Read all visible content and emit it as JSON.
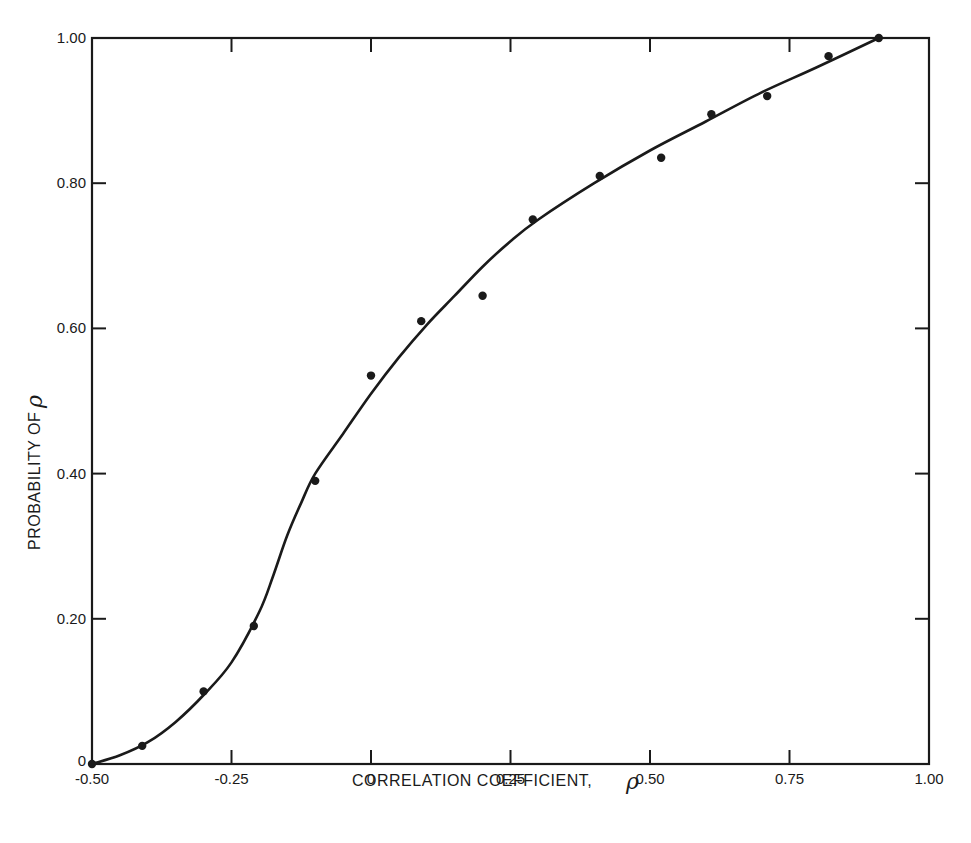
{
  "chart_data": {
    "type": "scatter",
    "title": "",
    "xlabel": "CORRELATION COEFFICIENT, ρ",
    "ylabel": "PROBABILITY OF ρ",
    "xlim": [
      -0.5,
      1.0
    ],
    "ylim": [
      0,
      1.0
    ],
    "grid": false,
    "legend": null,
    "x_ticks": [
      -0.5,
      -0.25,
      0,
      0.25,
      0.5,
      0.75,
      1.0
    ],
    "x_tick_labels": [
      "-0.50",
      "-0.25",
      "0",
      "0.25",
      "0.50",
      "0.75",
      "1.00"
    ],
    "y_ticks": [
      0,
      0.2,
      0.4,
      0.6,
      0.8,
      1.0
    ],
    "y_tick_labels": [
      "0",
      "0.20",
      "0.40",
      "0.60",
      "0.80",
      "1.00"
    ],
    "series": [
      {
        "name": "observed",
        "kind": "points",
        "x": [
          -0.5,
          -0.41,
          -0.3,
          -0.21,
          -0.1,
          0.0,
          0.09,
          0.2,
          0.29,
          0.41,
          0.52,
          0.61,
          0.71,
          0.82,
          0.91
        ],
        "y": [
          0.0,
          0.025,
          0.1,
          0.19,
          0.39,
          0.535,
          0.61,
          0.645,
          0.75,
          0.81,
          0.835,
          0.895,
          0.92,
          0.975,
          1.0
        ]
      },
      {
        "name": "fitted curve",
        "kind": "smooth-line",
        "x": [
          -0.5,
          -0.45,
          -0.4,
          -0.35,
          -0.3,
          -0.25,
          -0.2,
          -0.175,
          -0.15,
          -0.125,
          -0.1,
          -0.05,
          0.0,
          0.05,
          0.1,
          0.15,
          0.2,
          0.25,
          0.3,
          0.4,
          0.5,
          0.6,
          0.7,
          0.8,
          0.91
        ],
        "y": [
          0.0,
          0.012,
          0.03,
          0.058,
          0.095,
          0.14,
          0.21,
          0.26,
          0.315,
          0.36,
          0.4,
          0.455,
          0.51,
          0.56,
          0.605,
          0.645,
          0.685,
          0.72,
          0.75,
          0.8,
          0.845,
          0.885,
          0.925,
          0.96,
          1.0
        ]
      }
    ]
  },
  "labels": {
    "x_axis_title": "CORRELATION COEFFICIENT,",
    "y_axis_title": "PROBABILITY OF",
    "rho_symbol": "ρ"
  },
  "colors": {
    "ink": "#1a1a1a",
    "background": "#ffffff"
  }
}
